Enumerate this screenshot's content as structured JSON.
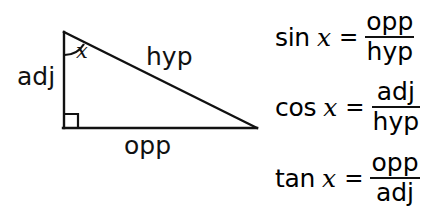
{
  "figure": {
    "background_color": "#ffffff",
    "stroke_color": "#111111"
  },
  "triangle": {
    "angle_label": "x",
    "right_angle_marker": "right-angle-square",
    "sides": {
      "adjacent_label": "adj",
      "hypotenuse_label": "hyp",
      "opposite_label": "opp"
    },
    "vertices": {
      "apex": [
        64,
        32
      ],
      "right_angle": [
        64,
        128
      ],
      "far": [
        256,
        128
      ]
    }
  },
  "formulas": [
    {
      "function": "sin",
      "argument": "x",
      "equals": "=",
      "numerator": "opp",
      "denominator": "hyp"
    },
    {
      "function": "cos",
      "argument": "x",
      "equals": "=",
      "numerator": "adj",
      "denominator": "hyp"
    },
    {
      "function": "tan",
      "argument": "x",
      "equals": "=",
      "numerator": "opp",
      "denominator": "adj"
    }
  ]
}
